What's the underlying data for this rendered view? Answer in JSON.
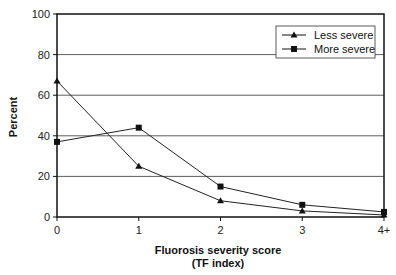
{
  "chart_data": {
    "type": "line",
    "title": "",
    "xlabel": "Fluorosis severity score",
    "xlabel_line2": "(TF index)",
    "ylabel": "Percent",
    "categories": [
      "0",
      "1",
      "2",
      "3",
      "4+"
    ],
    "yticks": [
      "0",
      "20",
      "40",
      "60",
      "80",
      "100"
    ],
    "ylim": [
      0,
      100
    ],
    "grid": "horizontal",
    "legend_position": "upper right (inside)",
    "series": [
      {
        "name": "Less severe",
        "marker": "triangle",
        "values": [
          67,
          25,
          8,
          3,
          1
        ]
      },
      {
        "name": "More severe",
        "marker": "square",
        "values": [
          37,
          44,
          15,
          6,
          2.5
        ]
      }
    ]
  }
}
